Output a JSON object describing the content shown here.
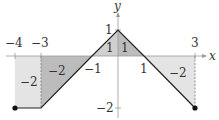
{
  "diagram": {
    "type": "piecewise-linear-graph-with-signed-areas",
    "axes": {
      "x_label": "x",
      "y_label": "y",
      "x_ticks": [
        {
          "value": -4,
          "label": "−4"
        },
        {
          "value": -3,
          "label": "−3"
        },
        {
          "value": -1,
          "label": "−1"
        },
        {
          "value": 1,
          "label": "1"
        },
        {
          "value": 3,
          "label": "3"
        }
      ],
      "y_ticks": [
        {
          "value": 1,
          "label": "1"
        },
        {
          "value": -2,
          "label": "−2"
        }
      ]
    },
    "function_points": [
      [
        -4,
        -2
      ],
      [
        -3,
        -2
      ],
      [
        -1,
        0
      ],
      [
        0,
        1
      ],
      [
        1,
        0
      ],
      [
        3,
        -2
      ]
    ],
    "endpoints": [
      [
        -4,
        -2
      ],
      [
        3,
        -2
      ]
    ],
    "regions": [
      {
        "name": "rect-left",
        "x_range": [
          -4,
          -3
        ],
        "area_label": "−2",
        "fill": "#e3e3e3"
      },
      {
        "name": "trapezoid-left",
        "x_range": [
          -3,
          -1
        ],
        "area_label": "−2",
        "fill": "#bdbdbd"
      },
      {
        "name": "triangle-left-pos",
        "x_range": [
          -1,
          0
        ],
        "area_label": "1",
        "fill": "#cfcfcf"
      },
      {
        "name": "triangle-right-pos",
        "x_range": [
          0,
          1
        ],
        "area_label": "1",
        "fill": "#bdbdbd"
      },
      {
        "name": "triangle-right-neg",
        "x_range": [
          1,
          3
        ],
        "area_label": "−2",
        "fill": "#e3e3e3"
      }
    ],
    "labels": {
      "x_axis": "x",
      "y_axis": "y",
      "tick_m4": "−4",
      "tick_m3": "−3",
      "tick_m1": "−1",
      "tick_1x": "1",
      "tick_3": "3",
      "tick_1y": "1",
      "tick_m2y": "−2",
      "area_rect_left": "−2",
      "area_trap_left": "−2",
      "area_tri_left": "1",
      "area_tri_right": "1",
      "area_tri_right_neg": "−2"
    }
  }
}
